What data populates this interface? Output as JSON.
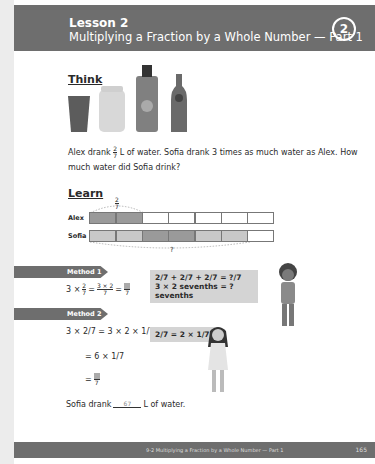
{
  "header": {
    "lesson": "Lesson 2",
    "subtitle": "Multiplying a Fraction by a Whole Number — Part 1",
    "number": "2"
  },
  "think": {
    "title": "Think",
    "icons": [
      "cup-icon",
      "jar-icon",
      "water-bottle-icon",
      "glass-bottle-icon"
    ]
  },
  "problem": {
    "before": "Alex drank",
    "frac_num": "2",
    "frac_den": "7",
    "after": "L of water. Sofia drank 3 times as much water as Alex. How much water did Sofia drink?"
  },
  "learn": {
    "title": "Learn",
    "top_label_num": "2",
    "top_label_den": "7",
    "rows": [
      {
        "label": "Alex",
        "cells": [
          "dark",
          "dark",
          "empty",
          "empty",
          "empty",
          "empty",
          "empty"
        ]
      },
      {
        "label": "Sofia",
        "cells": [
          "light",
          "light",
          "dark",
          "dark",
          "light",
          "light",
          "empty"
        ]
      }
    ],
    "bottom_label": "?"
  },
  "method1": {
    "label": "Method 1",
    "eq_lead": "3 ×",
    "eq_eq1": "=",
    "frac2_num": "3 × 2",
    "frac2_den": "7",
    "eq_eq2": "=",
    "ans_den": "7",
    "bubble_line1": "2/7 + 2/7 + 2/7 = ?/7",
    "bubble_line2": "3 × 2 sevenths = ? sevenths"
  },
  "method2": {
    "label": "Method 2",
    "line1": "3 × 2/7 = 3 × 2 × 1/7",
    "line2": "= 6 × 1/7",
    "line3_den": "7",
    "bubble": "2/7 = 2 × 1/7"
  },
  "answer": {
    "before": "Sofia drank",
    "blank_num": "6",
    "blank_den": "7",
    "after": "L of water."
  },
  "footer": {
    "text": "9-2 Multiplying a Fraction by a Whole Number — Part 1",
    "page": "165"
  }
}
